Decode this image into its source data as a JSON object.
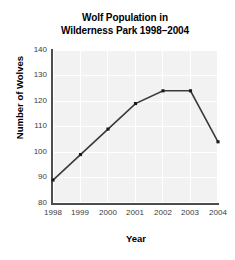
{
  "chart_data": {
    "type": "line",
    "title": "Wolf Population in Wilderness Park 1998–2004",
    "title_line1": "Wolf Population in",
    "title_line2": "Wilderness Park 1998–2004",
    "xlabel": "Year",
    "ylabel": "Number of Wolves",
    "categories": [
      "1998",
      "1999",
      "2000",
      "2001",
      "2002",
      "2003",
      "2004"
    ],
    "x": [
      1998,
      1999,
      2000,
      2001,
      2002,
      2003,
      2004
    ],
    "values": [
      89,
      99,
      109,
      119,
      124,
      124,
      104
    ],
    "series": [
      {
        "name": "Number of Wolves",
        "values": [
          89,
          99,
          109,
          119,
          124,
          124,
          104
        ]
      }
    ],
    "ylim": [
      80,
      140
    ],
    "yticks": [
      80,
      90,
      100,
      110,
      120,
      130,
      140
    ],
    "ytick_labels": [
      "80",
      "90",
      "100",
      "110",
      "120",
      "130",
      "140"
    ],
    "xtick_labels": [
      "1998",
      "1999",
      "2000",
      "2001",
      "2002",
      "2003",
      "2004"
    ],
    "grid": true,
    "grid_color": "#ffffff",
    "plot_background": "#f2f2f2",
    "line_color": "#3a3a3a",
    "marker": "square",
    "marker_color": "#1a1a1a",
    "legend": null,
    "legend_position": "none"
  }
}
